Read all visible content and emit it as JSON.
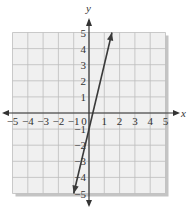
{
  "chart_data": {
    "type": "line",
    "title": "",
    "xlabel": "x",
    "ylabel": "y",
    "xlim": [
      -5,
      5
    ],
    "ylim": [
      -5,
      5
    ],
    "grid": true,
    "x_ticks": [
      "-5",
      "-4",
      "-3",
      "-2",
      "-1",
      "0",
      "1",
      "2",
      "3",
      "4",
      "5"
    ],
    "y_ticks": [
      "5",
      "4",
      "3",
      "2",
      "1",
      "-1",
      "-2",
      "-3",
      "-4",
      "-5"
    ],
    "series": [
      {
        "name": "line",
        "equation": "y = 4x - 1",
        "x": [
          -1,
          1.5
        ],
        "y": [
          -5,
          5
        ],
        "arrows": "both ends"
      }
    ]
  },
  "colors": {
    "grid_background": "#f0f0f0",
    "grid_lines": "#bdbdbd",
    "shadow": "#c4c4c4",
    "axis": "#333333",
    "line": "#3a3a3a"
  }
}
